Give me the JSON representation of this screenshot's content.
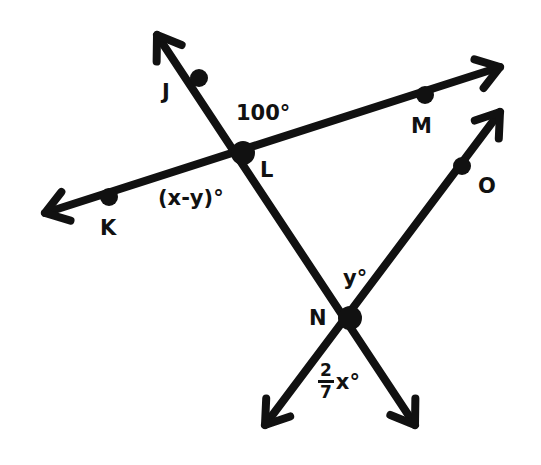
{
  "diagram": {
    "stroke_color": "#111111",
    "background": "#ffffff",
    "points": [
      {
        "name": "J",
        "x": 199,
        "y": 78,
        "label": "J",
        "label_x": 162,
        "label_y": 82
      },
      {
        "name": "L",
        "x": 243,
        "y": 153,
        "label": "L",
        "label_x": 260,
        "label_y": 160
      },
      {
        "name": "M",
        "x": 425,
        "y": 95,
        "label": "M",
        "label_x": 411,
        "label_y": 116
      },
      {
        "name": "K",
        "x": 109,
        "y": 197,
        "label": "K",
        "label_x": 100,
        "label_y": 218
      },
      {
        "name": "N",
        "x": 350,
        "y": 318,
        "label": "N",
        "label_x": 309,
        "label_y": 308
      },
      {
        "name": "O",
        "x": 462,
        "y": 166,
        "label": "O",
        "label_x": 478,
        "label_y": 176
      }
    ],
    "lines": [
      {
        "name": "line-J-N",
        "from": [
          157,
          35
        ],
        "to": [
          415,
          425
        ],
        "arrow_start": true,
        "arrow_end": true
      },
      {
        "name": "line-K-M",
        "from": [
          45,
          213
        ],
        "to": [
          500,
          67
        ],
        "arrow_start": true,
        "arrow_end": true
      },
      {
        "name": "line-N-O",
        "from": [
          265,
          425
        ],
        "to": [
          500,
          112
        ],
        "arrow_start": true,
        "arrow_end": true
      }
    ],
    "angle_labels": [
      {
        "name": "angle-JLM",
        "text": "100°",
        "x": 236,
        "y": 103
      },
      {
        "name": "angle-KLN",
        "text": "(x-y)°",
        "x": 158,
        "y": 188
      },
      {
        "name": "angle-at-N-top",
        "text": "y°",
        "x": 343,
        "y": 268
      },
      {
        "name": "angle-at-N-bottom",
        "numerator": "2",
        "denominator": "7",
        "rest": "x°",
        "x": 318,
        "y": 367
      }
    ]
  }
}
